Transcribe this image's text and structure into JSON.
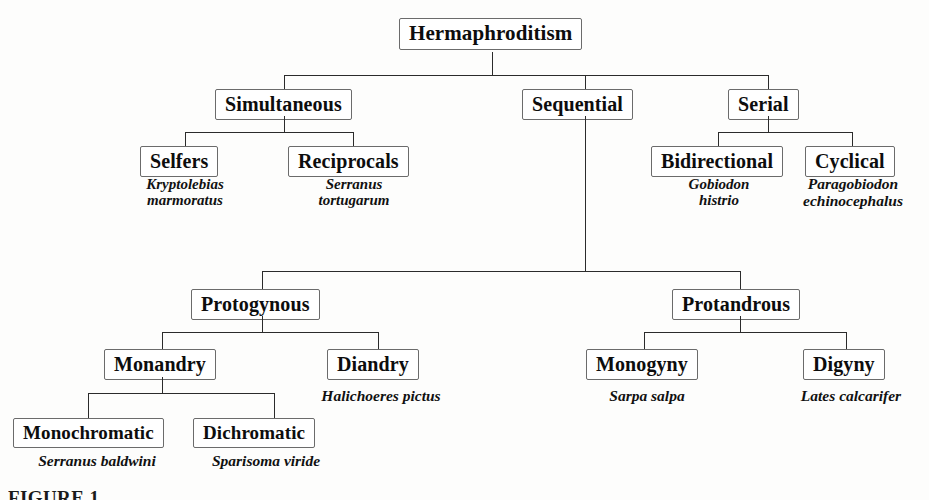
{
  "figure": {
    "caption": "FIGURE 1",
    "background_color": "#fdfdfc",
    "box_border_color": "#6b6b6b",
    "line_color": "#2b2b2b",
    "text_color": "#0d0d0d"
  },
  "nodes": {
    "root": "Hermaphroditism",
    "simultaneous": "Simultaneous",
    "sequential": "Sequential",
    "serial": "Serial",
    "selfers": "Selfers",
    "reciprocals": "Reciprocals",
    "bidirectional": "Bidirectional",
    "cyclical": "Cyclical",
    "protogynous": "Protogynous",
    "protandrous": "Protandrous",
    "monandry": "Monandry",
    "diandry": "Diandry",
    "monogyny": "Monogyny",
    "digyny": "Digyny",
    "monochromatic": "Monochromatic",
    "dichromatic": "Dichromatic"
  },
  "species": {
    "selfers": "Kryptolebias\nmarmoratus",
    "reciprocals": "Serranus\ntortugarum",
    "bidirectional": "Gobiodon\nhistrio",
    "cyclical": "Paragobiodon\nechinocephalus",
    "diandry": "Halichoeres pictus",
    "monogyny": "Sarpa salpa",
    "digyny": "Lates calcarifer",
    "monochromatic": "Serranus baldwini",
    "dichromatic": "Sparisoma viride"
  }
}
